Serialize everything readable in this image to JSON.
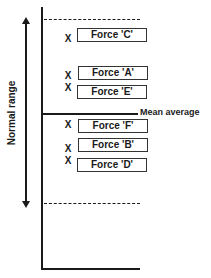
{
  "diagram": {
    "axis_label": "Normal range",
    "mean_label": "Mean average",
    "marker": "X",
    "forces": [
      {
        "label": "Force 'C'",
        "y": 28,
        "x_y": 33
      },
      {
        "label": "Force 'A'",
        "y": 66,
        "x_y": 71
      },
      {
        "label": "Force 'E'",
        "y": 84,
        "x_y": 83
      },
      {
        "label": "Force 'F'",
        "y": 119,
        "x_y": 120
      },
      {
        "label": "Force 'B'",
        "y": 138,
        "x_y": 143
      },
      {
        "label": "Force 'D'",
        "y": 157,
        "x_y": 156
      }
    ]
  }
}
